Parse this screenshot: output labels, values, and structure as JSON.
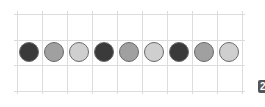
{
  "diagram": {
    "grid": {
      "columns_x": [
        17,
        42,
        67,
        92,
        117,
        142,
        167,
        192,
        217,
        242
      ],
      "rows_y": [
        14,
        40,
        65,
        91
      ],
      "line_color": "#dcdcdc"
    },
    "circles": [
      {
        "shade": "dark",
        "color": "#3a3a3a"
      },
      {
        "shade": "medium",
        "color": "#a0a0a0"
      },
      {
        "shade": "light",
        "color": "#cfcfcf"
      },
      {
        "shade": "dark",
        "color": "#3a3a3a"
      },
      {
        "shade": "medium",
        "color": "#a0a0a0"
      },
      {
        "shade": "light",
        "color": "#cfcfcf"
      },
      {
        "shade": "dark",
        "color": "#3a3a3a"
      },
      {
        "shade": "medium",
        "color": "#a0a0a0"
      },
      {
        "shade": "light",
        "color": "#cfcfcf"
      }
    ],
    "badge": "2"
  }
}
